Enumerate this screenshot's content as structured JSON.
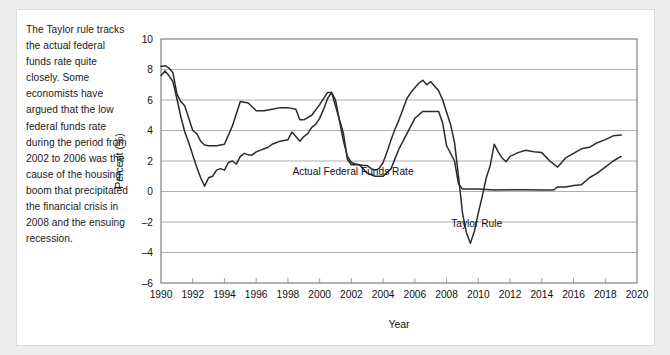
{
  "caption": {
    "text": "The Taylor rule tracks the actual federal funds rate quite closely. Some economists have argued that the low federal funds rate during the period from 2002 to 2006 was the cause of the housing boom that precipitated the financial crisis in 2008 and the ensuing recession."
  },
  "chart_data": {
    "type": "line",
    "title": "",
    "xlabel": "Year",
    "ylabel": "Percent (%)",
    "xlim": [
      1990,
      2020
    ],
    "ylim": [
      -6,
      10
    ],
    "xticks": [
      1990,
      1992,
      1994,
      1996,
      1998,
      2000,
      2002,
      2004,
      2006,
      2008,
      2010,
      2012,
      2014,
      2016,
      2018,
      2020
    ],
    "yticks": [
      -6,
      -4,
      -2,
      0,
      2,
      4,
      6,
      8,
      10
    ],
    "grid": "horizontal",
    "legend_position": "inline-annotations",
    "line_color": "#2b2b2b",
    "annotations": [
      {
        "label": "Actual Federal Funds Rate",
        "x": 2002.1,
        "y": 1.1
      },
      {
        "label": "Taylor Rule",
        "x": 2009.9,
        "y": -2.3
      }
    ],
    "series": [
      {
        "name": "Taylor Rule",
        "x": [
          1990.0,
          1990.25,
          1990.5,
          1990.75,
          1991.0,
          1991.25,
          1991.5,
          1991.75,
          1992.0,
          1992.25,
          1992.5,
          1992.75,
          1993.0,
          1993.25,
          1993.5,
          1993.75,
          1994.0,
          1994.25,
          1994.5,
          1994.75,
          1995.0,
          1995.25,
          1995.5,
          1995.75,
          1996.0,
          1996.25,
          1996.5,
          1996.75,
          1997.0,
          1997.25,
          1997.5,
          1997.75,
          1998.0,
          1998.25,
          1998.5,
          1998.75,
          1999.0,
          1999.25,
          1999.5,
          1999.75,
          2000.0,
          2000.25,
          2000.5,
          2000.75,
          2001.0,
          2001.25,
          2001.5,
          2001.75,
          2002.0,
          2002.25,
          2002.5,
          2002.75,
          2003.0,
          2003.25,
          2003.5,
          2003.75,
          2004.0,
          2004.25,
          2004.5,
          2004.75,
          2005.0,
          2005.25,
          2005.5,
          2005.75,
          2006.0,
          2006.25,
          2006.5,
          2006.75,
          2007.0,
          2007.25,
          2007.5,
          2007.75,
          2008.0,
          2008.25,
          2008.5,
          2008.75,
          2009.0,
          2009.25,
          2009.5,
          2009.75,
          2010.0,
          2010.25,
          2010.5,
          2010.75,
          2011.0,
          2011.25,
          2011.5,
          2011.75,
          2012.0,
          2012.5,
          2013.0,
          2013.5,
          2014.0,
          2014.5,
          2015.0,
          2015.5,
          2016.0,
          2016.5,
          2017.0,
          2017.5,
          2018.0,
          2018.5,
          2019.0
        ],
        "y": [
          7.6,
          7.9,
          7.6,
          7.2,
          6.1,
          4.9,
          3.9,
          3.2,
          2.4,
          1.6,
          0.9,
          0.35,
          0.9,
          1.0,
          1.4,
          1.5,
          1.4,
          1.9,
          2.0,
          1.8,
          2.3,
          2.5,
          2.4,
          2.4,
          2.6,
          2.7,
          2.8,
          2.9,
          3.1,
          3.2,
          3.3,
          3.35,
          3.4,
          3.9,
          3.6,
          3.3,
          3.6,
          3.8,
          4.2,
          4.4,
          4.8,
          5.4,
          6.1,
          6.5,
          6.0,
          4.6,
          3.3,
          2.3,
          1.9,
          1.8,
          1.75,
          1.7,
          1.7,
          1.5,
          1.4,
          1.5,
          1.9,
          2.6,
          3.4,
          4.1,
          4.7,
          5.4,
          6.1,
          6.5,
          6.8,
          7.1,
          7.3,
          7.0,
          7.2,
          6.9,
          6.6,
          6.0,
          5.2,
          4.4,
          3.2,
          1.0,
          -1.4,
          -2.7,
          -3.4,
          -2.6,
          -1.4,
          -0.3,
          0.9,
          1.7,
          3.1,
          2.6,
          2.2,
          1.95,
          2.3,
          2.55,
          2.7,
          2.6,
          2.55,
          2.0,
          1.6,
          2.2,
          2.5,
          2.8,
          2.9,
          3.2,
          3.4,
          3.65,
          3.7
        ]
      },
      {
        "name": "Actual Federal Funds Rate",
        "x": [
          1990.0,
          1990.25,
          1990.5,
          1990.75,
          1991.0,
          1991.25,
          1991.5,
          1991.75,
          1992.0,
          1992.25,
          1992.5,
          1992.75,
          1993.0,
          1993.5,
          1994.0,
          1994.5,
          1995.0,
          1995.5,
          1996.0,
          1996.5,
          1997.0,
          1997.5,
          1998.0,
          1998.5,
          1998.75,
          1999.0,
          1999.5,
          2000.0,
          2000.5,
          2000.75,
          2001.0,
          2001.5,
          2001.75,
          2002.0,
          2002.5,
          2003.0,
          2003.5,
          2004.0,
          2004.5,
          2005.0,
          2005.5,
          2006.0,
          2006.5,
          2007.0,
          2007.5,
          2007.75,
          2008.0,
          2008.5,
          2008.75,
          2009.0,
          2009.5,
          2010.0,
          2011.0,
          2012.0,
          2013.0,
          2014.0,
          2014.75,
          2015.0,
          2015.5,
          2016.0,
          2016.5,
          2017.0,
          2017.5,
          2018.0,
          2018.5,
          2019.0
        ],
        "y": [
          8.2,
          8.25,
          8.1,
          7.8,
          6.4,
          5.9,
          5.6,
          4.8,
          4.0,
          3.8,
          3.3,
          3.05,
          3.0,
          3.0,
          3.1,
          4.3,
          5.9,
          5.8,
          5.3,
          5.3,
          5.4,
          5.5,
          5.5,
          5.4,
          4.7,
          4.7,
          5.0,
          5.7,
          6.5,
          6.5,
          5.6,
          3.8,
          2.1,
          1.75,
          1.75,
          1.2,
          1.0,
          1.0,
          1.5,
          2.8,
          3.8,
          4.8,
          5.25,
          5.25,
          5.25,
          4.5,
          3.0,
          2.0,
          0.5,
          0.16,
          0.16,
          0.16,
          0.1,
          0.12,
          0.12,
          0.1,
          0.1,
          0.3,
          0.3,
          0.4,
          0.45,
          0.9,
          1.2,
          1.6,
          2.0,
          2.3
        ]
      }
    ]
  },
  "axis": {
    "x_title": "Year",
    "y_title": "Percent (%)"
  }
}
